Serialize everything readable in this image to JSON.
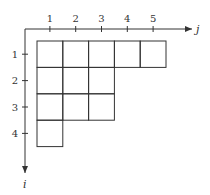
{
  "diagram": {
    "type": "young-diagram",
    "axes": {
      "horizontal": {
        "label": "j",
        "ticks": [
          "1",
          "2",
          "3",
          "4",
          "5"
        ]
      },
      "vertical": {
        "label": "i",
        "ticks": [
          "1",
          "2",
          "3",
          "4"
        ]
      }
    },
    "row_lengths": [
      5,
      3,
      3,
      1
    ],
    "colors": {
      "line": "#333333",
      "background": "#ffffff"
    }
  }
}
